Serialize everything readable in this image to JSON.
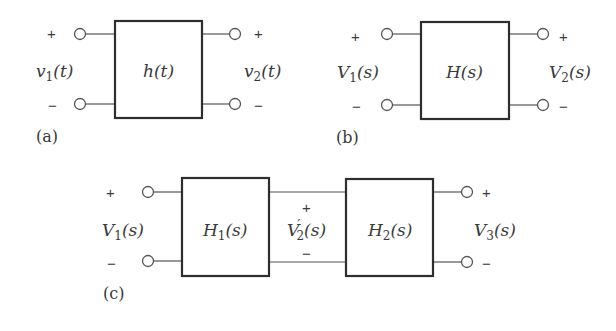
{
  "diagrams": {
    "a": {
      "label": "(a)",
      "block": "h(t)",
      "input": {
        "name": "v",
        "sub": "1",
        "arg": "(t)",
        "plus": "+",
        "minus": "−"
      },
      "output": {
        "name": "v",
        "sub": "2",
        "arg": "(t)",
        "plus": "+",
        "minus": "−"
      }
    },
    "b": {
      "label": "(b)",
      "block": "H(s)",
      "input": {
        "name": "V",
        "sub": "1",
        "arg": "(s)",
        "plus": "+",
        "minus": "−"
      },
      "output": {
        "name": "V",
        "sub": "2",
        "arg": "(s)",
        "plus": "+",
        "minus": "−"
      }
    },
    "c": {
      "label": "(c)",
      "block1": {
        "name": "H",
        "sub": "1",
        "arg": "(s)"
      },
      "block2": {
        "name": "H",
        "sub": "2",
        "arg": "(s)"
      },
      "input": {
        "name": "V",
        "sub": "1",
        "arg": "(s)",
        "plus": "+",
        "minus": "−"
      },
      "middle": {
        "name": "V",
        "prime": "′",
        "sub": "2",
        "arg": "(s)",
        "plus": "+",
        "minus": "−"
      },
      "output": {
        "name": "V",
        "sub": "3",
        "arg": "(s)",
        "plus": "+",
        "minus": "−"
      }
    }
  },
  "colors": {
    "line": "#2e2e2e",
    "text": "#3a3a3a",
    "background": "#ffffff"
  }
}
